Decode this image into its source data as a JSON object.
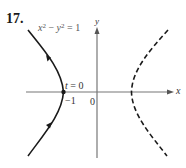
{
  "problem": {
    "number": "17."
  },
  "equation": {
    "lhs_x": "x",
    "lhs_y": "y",
    "exp": "2",
    "minus": " − ",
    "rhs": " = 1"
  },
  "labels": {
    "t_var": "t",
    "t_eq": " = 0",
    "neg_one": "−1",
    "origin": "0",
    "y_axis": "y",
    "x_axis": "x"
  },
  "curves": {
    "left_branch": {
      "style": "solid",
      "vertex": [
        -1,
        0
      ],
      "direction_arrows": 2
    },
    "right_branch": {
      "style": "dashed",
      "vertex": [
        1,
        0
      ]
    }
  },
  "colors": {
    "curve": "#1a1a1a",
    "axis": "#777777",
    "text": "#333333"
  }
}
